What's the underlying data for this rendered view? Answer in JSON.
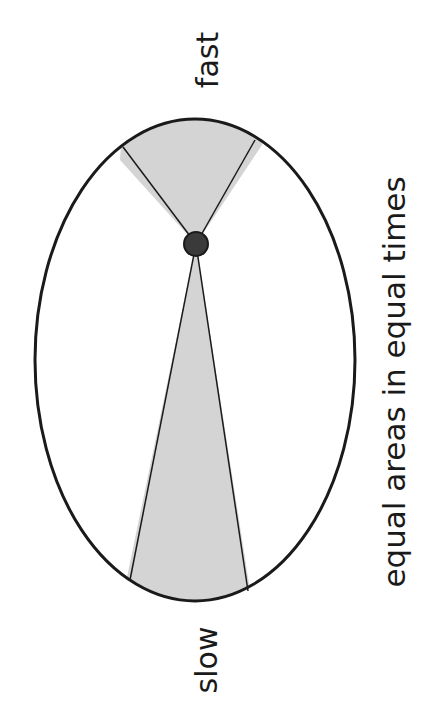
{
  "diagram": {
    "labels": {
      "fast": "fast",
      "slow": "slow",
      "caption": "equal areas in equal times"
    },
    "colors": {
      "background": "#ffffff",
      "stroke": "#1a1a1a",
      "sector_fill": "#d4d4d4",
      "focus_fill": "#3a3a3a"
    },
    "ellipse": {
      "cx": 195,
      "cy": 360,
      "rx": 160,
      "ry": 241
    },
    "focus": {
      "x": 196,
      "y": 244,
      "r": 12
    }
  }
}
